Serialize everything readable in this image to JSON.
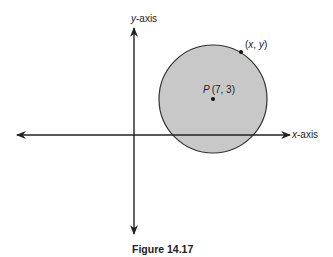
{
  "figure": {
    "caption": "Figure 14.17",
    "axes": {
      "x_label": "x-axis",
      "x_label_var": "x",
      "x_label_suffix": "-axis",
      "y_label": "y-axis",
      "y_label_var": "y",
      "y_label_suffix": "-axis"
    },
    "circle": {
      "fill_color": "#c8c8c8",
      "stroke_color": "#333333"
    },
    "center_point": {
      "label": "P (7, 3)",
      "name": "P",
      "coords": "(7, 3)"
    },
    "circumference_point": {
      "label": "(x, y)",
      "open": "(",
      "x": "x",
      "sep": ", ",
      "y": "y",
      "close": ")"
    }
  }
}
